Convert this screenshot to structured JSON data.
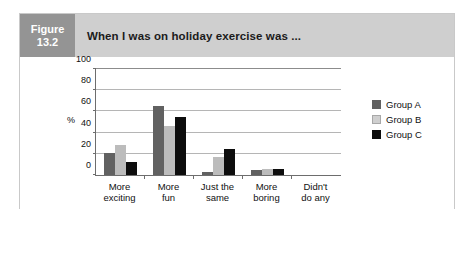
{
  "figure": {
    "tag_line1": "Figure",
    "tag_line2": "13.2",
    "title": "When I was on holiday exercise was ...",
    "tag_color": "#949494",
    "strip_color": "#cfcfcf"
  },
  "chart_data": {
    "type": "bar",
    "title": "When I was on holiday exercise was ...",
    "xlabel": "",
    "ylabel": "%",
    "ylim": [
      0,
      100
    ],
    "yticks": [
      0,
      20,
      40,
      60,
      80,
      100
    ],
    "ytick_labels": [
      "0",
      "20",
      "40",
      "60",
      "80",
      "100"
    ],
    "grid": true,
    "legend_position": "right",
    "categories": [
      "More exciting",
      "More fun",
      "Just the same",
      "More boring",
      "Didn't do any"
    ],
    "category_lines": [
      [
        "More",
        "exciting"
      ],
      [
        "More",
        "fun"
      ],
      [
        "Just the",
        "same"
      ],
      [
        "More",
        "boring"
      ],
      [
        "Didn't",
        "do any"
      ]
    ],
    "series": [
      {
        "name": "Group A",
        "color": "#616161",
        "values": [
          21,
          65,
          3,
          5,
          0
        ]
      },
      {
        "name": "Group B",
        "color": "#bcbcbc",
        "values": [
          28,
          46,
          17,
          6,
          0
        ]
      },
      {
        "name": "Group C",
        "color": "#0d0d0d",
        "values": [
          12,
          55,
          25,
          6,
          0
        ]
      }
    ]
  }
}
